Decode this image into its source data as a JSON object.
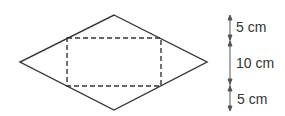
{
  "diagram": {
    "shape": "rhombus with inscribed dashed rectangle",
    "colors": {
      "stroke": "#333333",
      "background": "#ffffff"
    },
    "rhombus": {
      "top": [
        114,
        15
      ],
      "right": [
        207,
        62
      ],
      "bottom": [
        114,
        110
      ],
      "left": [
        20,
        62
      ]
    },
    "rectangle": {
      "x": 67,
      "y": 38,
      "width": 94,
      "height": 48,
      "style": "dashed"
    },
    "dimension_labels": [
      {
        "text": "5 cm"
      },
      {
        "text": "10 cm"
      },
      {
        "text": "5 cm"
      }
    ]
  }
}
